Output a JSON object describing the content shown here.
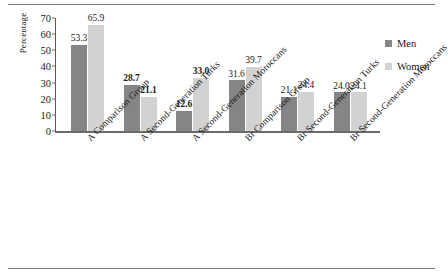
{
  "chart_data": {
    "type": "bar",
    "title": "",
    "xlabel": "",
    "ylabel": "Percentage",
    "ylim": [
      0,
      70
    ],
    "yticks": [
      0,
      10,
      20,
      30,
      40,
      50,
      60,
      70
    ],
    "grid": false,
    "legend_position": "right",
    "categories": [
      "A Comparison Group",
      "A Second-Generation Turks",
      "A Second-Generation Moroccans",
      "Br Comparison Group",
      "Br Second-Generation Turks",
      "Br Second-Generation Moroccans"
    ],
    "series": [
      {
        "name": "Men",
        "color": "#858585",
        "values": [
          53.3,
          28.7,
          12.6,
          31.6,
          21.1,
          24.0
        ],
        "labels": [
          "53.3",
          "28.7",
          "12.6",
          "31.6",
          "21.1",
          "24.0"
        ],
        "label_bold": [
          false,
          true,
          true,
          false,
          false,
          false
        ]
      },
      {
        "name": "Women",
        "color": "#d2d2d2",
        "values": [
          65.9,
          21.1,
          33.0,
          39.7,
          24.4,
          24.1
        ],
        "labels": [
          "65.9",
          "21.1",
          "33.0",
          "39.7",
          "24.4",
          "24.1"
        ],
        "label_bold": [
          false,
          true,
          true,
          false,
          false,
          false
        ]
      }
    ]
  },
  "legend": {
    "items": [
      {
        "label": "Men",
        "color": "#858585"
      },
      {
        "label": "Women",
        "color": "#d2d2d2"
      }
    ]
  },
  "axis": {
    "y_title": "Percentage",
    "y_ticks": [
      "70",
      "60",
      "50",
      "40",
      "30",
      "20",
      "10",
      "0"
    ]
  }
}
